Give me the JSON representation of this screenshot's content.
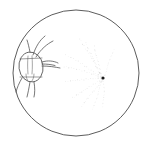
{
  "figure": {
    "caption": "",
    "background_color": "#ffffff",
    "ink_color": "#3a3a3a",
    "faint_ink_color": "#b9b9b9",
    "very_faint_ink_color": "#d2d2d2",
    "dark_node_color": "#1a1a1a"
  },
  "field_circle": {
    "name": "microscope-field-boundary",
    "center_x": 76,
    "center_y": 73,
    "radius": 63,
    "stroke_width": 0.9,
    "stroke_color": "#4a4a4a"
  },
  "organism": {
    "name": "mite-body",
    "body_center_x": 31,
    "body_center_y": 67,
    "body_rx": 12,
    "body_ry": 15,
    "body_rotation_deg": -8,
    "stroke_color": "#555555",
    "stroke_width": 0.8,
    "internal_marks": [
      {
        "name": "dorsal-midline",
        "d": "M 28 56 C 27.5 62, 27.5 68, 28 74"
      },
      {
        "name": "dorsal-midline-right",
        "d": "M 32 56 C 32.5 62, 32.5 68, 32 74"
      },
      {
        "name": "ventral-fold-left",
        "d": "M 26 74 C 26 77, 27 80, 28.5 81.5"
      },
      {
        "name": "ventral-fold-right",
        "d": "M 34 74 C 34 77, 33 80, 31.5 81.5"
      }
    ],
    "appendages": [
      {
        "name": "leg-anterodorsal-1",
        "d": "M 33 55 C 36 46, 40 40, 45 36"
      },
      {
        "name": "leg-anterodorsal-2",
        "d": "M 36 57 C 41 49, 47 44, 53 41"
      },
      {
        "name": "leg-dorsal-short",
        "d": "M 30 52 C 29 47, 28 43, 27 40"
      },
      {
        "name": "chelicera-upper",
        "d": "M 42 62 C 48 60, 54 61, 58 63"
      },
      {
        "name": "chelicera-lower",
        "d": "M 42 66 C 49 66, 55 67, 60 68"
      },
      {
        "name": "palp-mid",
        "d": "M 42 64 C 47 64, 51 64.5, 55 65.5"
      },
      {
        "name": "leg-posteroventral-1",
        "d": "M 30 82 C 29 88, 28 93, 27 97"
      },
      {
        "name": "leg-posteroventral-2",
        "d": "M 34 82 C 35 88, 35 93, 34 97"
      },
      {
        "name": "leg-ventral-lateral",
        "d": "M 22 78 C 19 83, 17 88, 16 92"
      }
    ],
    "hatch_marks": [
      {
        "name": "hatch-upper",
        "d": "M 20 59 L 42 58"
      },
      {
        "name": "hatch-lower",
        "d": "M 20 77 L 42 77"
      }
    ]
  },
  "stipple_field": {
    "name": "radiating-stipple-arcs",
    "convergence_point": {
      "x": 103,
      "y": 78
    },
    "dark_node": {
      "x": 103,
      "y": 78,
      "r": 1.6
    },
    "description": "Faint dotted arcs fanning out from a convergence node toward upper-left, left and lower-left",
    "arcs": [
      {
        "name": "stipple-arc-1",
        "d": "M 103 78 C 92 60, 84 46, 79 36",
        "opacity": 0.55
      },
      {
        "name": "stipple-arc-2",
        "d": "M 103 78 C 94 62, 88 50, 86 40",
        "opacity": 0.5
      },
      {
        "name": "stipple-arc-3",
        "d": "M 103 78 C 97 63, 95 52, 95 43",
        "opacity": 0.45
      },
      {
        "name": "stipple-arc-4",
        "d": "M 103 78 C 86 66, 73 58, 63 54",
        "opacity": 0.5
      },
      {
        "name": "stipple-arc-5",
        "d": "M 103 78 C 88 72, 74 68, 62 66",
        "opacity": 0.55
      },
      {
        "name": "stipple-arc-6",
        "d": "M 103 78 C 89 79, 75 80, 63 82",
        "opacity": 0.5
      },
      {
        "name": "stipple-arc-7",
        "d": "M 103 78 C 92 86, 80 93, 70 99",
        "opacity": 0.45
      },
      {
        "name": "stipple-arc-8",
        "d": "M 103 78 C 95 90, 87 100, 80 108",
        "opacity": 0.45
      },
      {
        "name": "stipple-arc-9",
        "d": "M 103 78 C 99 91, 95 102, 92 111",
        "opacity": 0.4
      },
      {
        "name": "stipple-arc-10",
        "d": "M 103 78 C 104 90, 104 100, 103 108",
        "opacity": 0.35
      },
      {
        "name": "stipple-arc-11",
        "d": "M 103 78 C 108 66, 112 56, 114 48",
        "opacity": 0.35
      }
    ],
    "dot_count_per_arc": 16,
    "dot_radius": 0.45
  }
}
